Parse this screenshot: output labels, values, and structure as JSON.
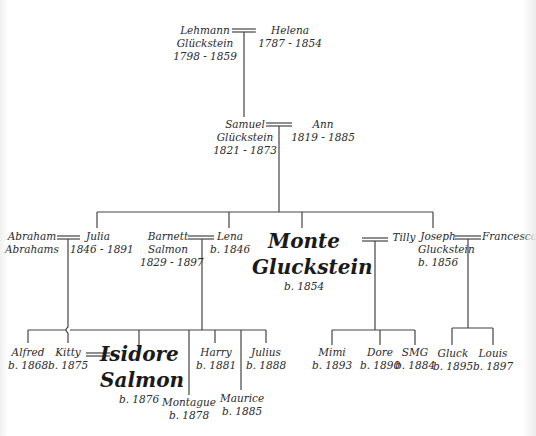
{
  "colors": {
    "line": "#444444",
    "text": "#2a2a2a",
    "background": "#ffffff"
  },
  "generation0": {
    "lehmann": {
      "lines": [
        "Lehmann",
        "Glückstein",
        "1798 - 1859"
      ]
    },
    "helena": {
      "lines": [
        "Helena",
        "1787 - 1854"
      ]
    }
  },
  "generation1": {
    "samuel": {
      "lines": [
        "Samuel",
        "Glückstein",
        "1821 - 1873"
      ]
    },
    "ann": {
      "lines": [
        "Ann",
        "1819 - 1885"
      ]
    }
  },
  "generation2": {
    "abraham": {
      "lines": [
        "Abraham",
        "Abrahams"
      ]
    },
    "julia": {
      "lines": [
        "Julia",
        "1846 - 1891"
      ]
    },
    "barnett": {
      "lines": [
        "Barnett",
        "Salmon",
        "1829 - 1897"
      ]
    },
    "lena": {
      "lines": [
        "Lena",
        "b. 1846"
      ]
    },
    "monte": {
      "name1": "Monte",
      "name2": "Gluckstein",
      "born": "b. 1854"
    },
    "tilly": {
      "lines": [
        "Tilly"
      ]
    },
    "joseph": {
      "lines": [
        "Joseph",
        "Gluckstein",
        "b. 1856"
      ]
    },
    "francesca": {
      "lines": [
        "Francesca"
      ]
    }
  },
  "generation3": {
    "alfred": {
      "lines": [
        "Alfred",
        "b. 1868"
      ]
    },
    "kitty": {
      "lines": [
        "Kitty",
        "b. 1875"
      ]
    },
    "isidore": {
      "name1": "Isidore",
      "name2": "Salmon",
      "born": "b. 1876"
    },
    "montague": {
      "lines": [
        "Montague",
        "b. 1878"
      ]
    },
    "harry": {
      "lines": [
        "Harry",
        "b. 1881"
      ]
    },
    "maurice": {
      "lines": [
        "Maurice",
        "b. 1885"
      ]
    },
    "julius": {
      "lines": [
        "Julius",
        "b. 1888"
      ]
    },
    "mimi": {
      "lines": [
        "Mimi",
        "b. 1893"
      ]
    },
    "dore": {
      "lines": [
        "Dore",
        "b. 1890"
      ]
    },
    "smg": {
      "lines": [
        "SMG",
        "b. 1884"
      ]
    },
    "gluck": {
      "lines": [
        "Gluck",
        "b. 1895"
      ]
    },
    "louis": {
      "lines": [
        "Louis",
        "b. 1897"
      ]
    }
  }
}
